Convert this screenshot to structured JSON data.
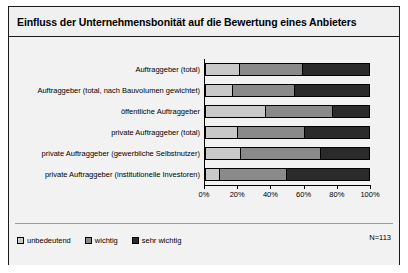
{
  "chart_data": {
    "type": "bar",
    "orientation": "horizontal",
    "stacked": true,
    "stacked_percent": true,
    "title": "Einfluss der Unternehmensbonität auf die Bewertung eines Anbieters",
    "xlabel": "",
    "ylabel": "",
    "xlim": [
      0,
      100
    ],
    "xticks": [
      "0%",
      "20%",
      "40%",
      "60%",
      "80%",
      "100%"
    ],
    "xtick_values": [
      0,
      20,
      40,
      60,
      80,
      100
    ],
    "grid": false,
    "legend_position": "bottom-left",
    "sample_note": "N=113",
    "categories": [
      "Auftraggeber (total)",
      "Auftraggeber (total, nach Bauvolumen gewichtet)",
      "öffentliche Auftraggeber",
      "private Auftraggeber (total)",
      "private Auftraggeber (gewerbliche Selbstnutzer)",
      "private Auftraggeber (institutionelle Investoren)"
    ],
    "series": [
      {
        "name": "unbedeutend",
        "color": "#c9c9c9",
        "values": [
          20,
          16,
          36,
          19,
          21,
          8
        ]
      },
      {
        "name": "wichtig",
        "color": "#8a8a8a",
        "values": [
          39,
          38,
          41,
          41,
          49,
          41
        ]
      },
      {
        "name": "sehr wichtig",
        "color": "#2b2b2b",
        "values": [
          41,
          46,
          23,
          40,
          30,
          51
        ]
      }
    ]
  },
  "legend": {
    "items": [
      {
        "label": "unbedeutend"
      },
      {
        "label": "wichtig"
      },
      {
        "label": "sehr wichtig"
      }
    ]
  }
}
